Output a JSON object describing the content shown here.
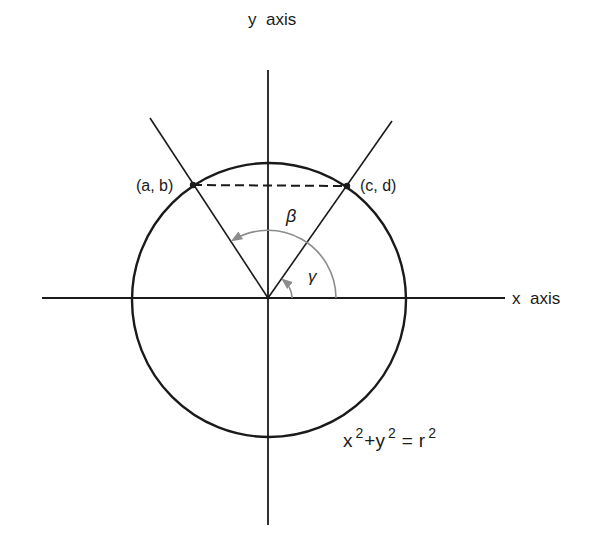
{
  "diagram": {
    "type": "unit-circle-angles",
    "axes": {
      "x_label": "x  axis",
      "y_label": "y  axis"
    },
    "points": {
      "left": {
        "label": "(a, b)"
      },
      "right": {
        "label": "(c, d)"
      }
    },
    "angles": {
      "outer": {
        "symbol": "β"
      },
      "inner": {
        "symbol": "γ"
      }
    },
    "equation": {
      "x": "x",
      "x_exp": "2",
      "plus": "+",
      "y": "y",
      "y_exp": "2",
      "equals": "=",
      "r": "r",
      "r_exp": "2"
    },
    "colors": {
      "line": "#1a1a1a",
      "arc": "#8c8c8c",
      "background": "#ffffff"
    }
  }
}
